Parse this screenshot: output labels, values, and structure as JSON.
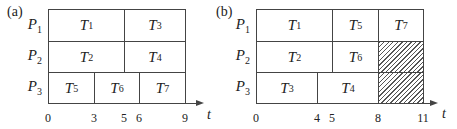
{
  "panels": [
    {
      "label": "(a)",
      "processors": [
        "P1",
        "P2",
        "P3"
      ],
      "tasks": [
        {
          "name": "T1",
          "proc": 1,
          "start": 0,
          "end": 5
        },
        {
          "name": "T3",
          "proc": 1,
          "start": 5,
          "end": 9
        },
        {
          "name": "T2",
          "proc": 2,
          "start": 0,
          "end": 5
        },
        {
          "name": "T4",
          "proc": 2,
          "start": 5,
          "end": 9
        },
        {
          "name": "T5",
          "proc": 3,
          "start": 0,
          "end": 3
        },
        {
          "name": "T6",
          "proc": 3,
          "start": 3,
          "end": 6
        },
        {
          "name": "T7",
          "proc": 3,
          "start": 6,
          "end": 9
        }
      ],
      "idle": [],
      "ticks": [
        "0",
        "3",
        "5",
        "6",
        "9"
      ],
      "axis_label": "t"
    },
    {
      "label": "(b)",
      "processors": [
        "P1",
        "P2",
        "P3"
      ],
      "tasks": [
        {
          "name": "T1",
          "proc": 1,
          "start": 0,
          "end": 5
        },
        {
          "name": "T5",
          "proc": 1,
          "start": 5,
          "end": 8
        },
        {
          "name": "T7",
          "proc": 1,
          "start": 8,
          "end": 11
        },
        {
          "name": "T2",
          "proc": 2,
          "start": 0,
          "end": 5
        },
        {
          "name": "T6",
          "proc": 2,
          "start": 5,
          "end": 8
        },
        {
          "name": "T3",
          "proc": 3,
          "start": 0,
          "end": 4
        },
        {
          "name": "T4",
          "proc": 3,
          "start": 4,
          "end": 8
        }
      ],
      "idle": [
        {
          "proc": 2,
          "start": 8,
          "end": 11
        },
        {
          "proc": 3,
          "start": 8,
          "end": 11
        }
      ],
      "ticks": [
        "0",
        "4",
        "5",
        "8",
        "11"
      ],
      "axis_label": "t"
    }
  ]
}
